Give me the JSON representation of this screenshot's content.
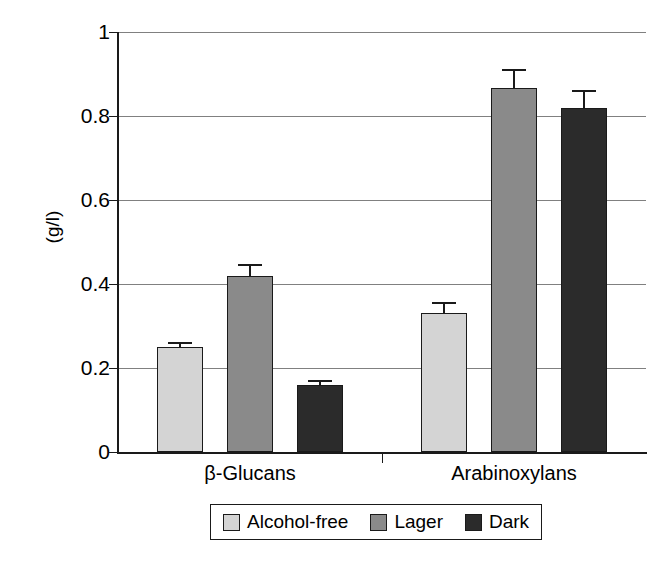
{
  "chart_data": {
    "type": "bar",
    "title": "",
    "xlabel": "",
    "ylabel": "(g/l)",
    "ylim": [
      0,
      1
    ],
    "yticks": [
      "0",
      "0.2",
      "0.4",
      "0.6",
      "0.8",
      "1"
    ],
    "ytick_values": [
      0,
      0.2,
      0.4,
      0.6,
      0.8,
      1
    ],
    "grid": "horizontal",
    "legend_position": "bottom",
    "categories": [
      "β-Glucans",
      "Arabinoxylans"
    ],
    "series": [
      {
        "name": "Alcohol-free",
        "color": "#d4d4d4",
        "values": [
          0.25,
          0.33
        ],
        "errors": [
          0.012,
          0.028
        ]
      },
      {
        "name": "Lager",
        "color": "#8a8a8a",
        "values": [
          0.42,
          0.867
        ],
        "errors": [
          0.028,
          0.045
        ]
      },
      {
        "name": "Dark",
        "color": "#2b2b2b",
        "values": [
          0.16,
          0.818
        ],
        "errors": [
          0.012,
          0.045
        ]
      }
    ]
  },
  "legend": {
    "items": [
      {
        "label": "Alcohol-free",
        "swatch": "legend-swatch-alcohol-free"
      },
      {
        "label": "Lager",
        "swatch": "legend-swatch-lager"
      },
      {
        "label": "Dark",
        "swatch": "legend-swatch-dark"
      }
    ]
  }
}
